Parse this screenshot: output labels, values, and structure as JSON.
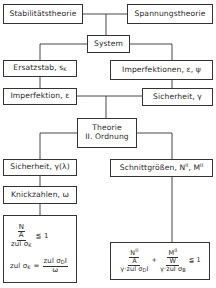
{
  "diagram": {
    "nodes": {
      "stabilitaetstheorie": "Stabilitätstheorie",
      "spannungstheorie": "Spannungstheorie",
      "system": "System",
      "ersatzstab": "Ersatzstab, s",
      "ersatzstab_sub": "K",
      "imperfektionen": "Imperfektionen, ε, ψ",
      "imperfektion": "Imperfektion, ε",
      "sicherheit": "Sicherheit, γ",
      "theorie_line1": "Theorie",
      "theorie_line2": "II. Ordnung",
      "sicherheit_lambda": "Sicherheit, γ(λ)",
      "schnittgroessen": "Schnittgrößen, N",
      "schnittgroessen_sup1": "II",
      "schnittgroessen_mid": ", M",
      "schnittgroessen_sup2": "II",
      "knickzahlen": "Knickzahlen, ω"
    },
    "left_formula": {
      "f1_num_top": "N",
      "f1_num_bottom": "A",
      "f1_den": "zul σ",
      "f1_den_sub": "K",
      "f1_rel": "≦ 1",
      "f2_lhs": "zul σ",
      "f2_lhs_sub": "K",
      "f2_eq": "=",
      "f2_num": "zul σ",
      "f2_num_sub": "D",
      "f2_num_suffix": "I",
      "f2_den": "ω"
    },
    "right_formula": {
      "t1_num_top": "N",
      "t1_num_top_sup": "II",
      "t1_num_bottom": "A",
      "t1_den": "γ·zul σ",
      "t1_den_sub": "D",
      "t1_den_suffix": "I",
      "plus": "+",
      "t2_num_top": "M",
      "t2_num_top_sup": "II",
      "t2_num_bottom": "W",
      "t2_den": "γ·zul σ",
      "t2_den_sub": "B",
      "rel": "≦ 1"
    }
  }
}
